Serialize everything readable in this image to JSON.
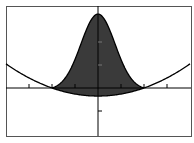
{
  "chart_data": {
    "type": "area",
    "title": "",
    "xlabel": "",
    "ylabel": "",
    "xlim": [
      -4.0,
      4.0
    ],
    "ylim": [
      -2.1,
      3.5
    ],
    "grid": false,
    "legend": null,
    "x_ticks": [
      -3,
      -2,
      -1,
      1,
      2,
      3
    ],
    "y_ticks": [
      -1,
      1,
      2
    ],
    "tick_labels": false,
    "series": [
      {
        "name": "bell curve",
        "function": "3*exp(-x^2) shifted to cross zero at x=+-2",
        "peak": [
          0,
          2.95
        ],
        "zeros": [
          -2,
          2
        ]
      },
      {
        "name": "parabola",
        "function": "0.0875*x^2 - 0.35",
        "vertex": [
          0,
          -0.35
        ],
        "zeros": [
          -2,
          2
        ]
      }
    ],
    "shaded_region": {
      "between": [
        "bell curve",
        "parabola"
      ],
      "x_range": [
        -2,
        2
      ],
      "color": "#3a3a3a"
    },
    "colors": {
      "curve": "#000000",
      "fill": "#3a3a3a",
      "frame": "#555555",
      "background": "#ffffff"
    }
  }
}
